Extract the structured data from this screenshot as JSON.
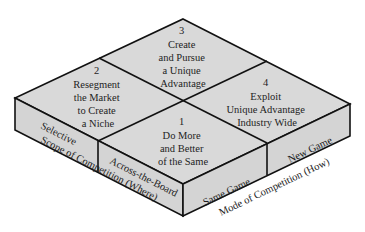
{
  "colors": {
    "fill_top": "#d9d9d9",
    "fill_side": "#d4d4d4",
    "stroke": "#111111",
    "background": "#ffffff"
  },
  "cells": [
    {
      "number": "1",
      "lines": [
        "Do More",
        "and Better",
        "of the Same"
      ]
    },
    {
      "number": "2",
      "lines": [
        "Resegment",
        "the Market",
        "to Create",
        "a Niche"
      ]
    },
    {
      "number": "3",
      "lines": [
        "Create",
        "and Pursue",
        "a Unique",
        "Advantage"
      ]
    },
    {
      "number": "4",
      "lines": [
        "Exploit",
        "Unique Advantage",
        "Industry Wide"
      ]
    }
  ],
  "scope_axis": {
    "title": "Scope of Competition (Where)",
    "options": [
      "Selective",
      "Across-the-Board"
    ]
  },
  "mode_axis": {
    "title": "Mode of Competition (How)",
    "options": [
      "Same Game",
      "New Game"
    ]
  }
}
